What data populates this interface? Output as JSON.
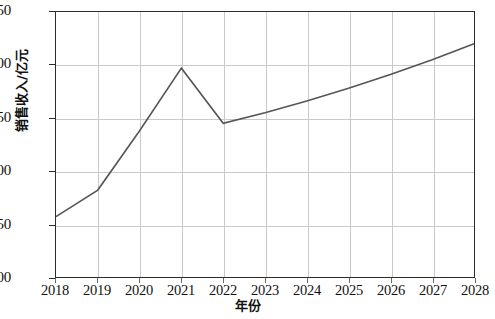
{
  "chart_data": {
    "type": "line",
    "title": "",
    "subtitle": "",
    "xlabel": "年份",
    "ylabel": "销售收入/亿元",
    "x": [
      2018,
      2019,
      2020,
      2021,
      2022,
      2023,
      2024,
      2025,
      2026,
      2027,
      2028
    ],
    "categories": [
      "2018",
      "2019",
      "2020",
      "2021",
      "2022",
      "2023",
      "2024",
      "2025",
      "2026",
      "2027",
      "2028"
    ],
    "values": [
      257,
      282,
      338,
      397,
      345,
      355,
      366,
      378,
      391,
      405,
      420
    ],
    "series": [
      {
        "name": "销售收入",
        "values": [
          257,
          282,
          338,
          397,
          345,
          355,
          366,
          378,
          391,
          405,
          420
        ]
      }
    ],
    "xlim": [
      2018,
      2028
    ],
    "ylim": [
      200,
      450
    ],
    "yticks": [
      200,
      250,
      300,
      350,
      400,
      450
    ],
    "ytick_labels": [
      "200",
      "250",
      "300",
      "350",
      "400",
      "450"
    ],
    "xticks": [
      2018,
      2019,
      2020,
      2021,
      2022,
      2023,
      2024,
      2025,
      2026,
      2027,
      2028
    ],
    "xtick_labels": [
      "2018",
      "2019",
      "2020",
      "2021",
      "2022",
      "2023",
      "2024",
      "2025",
      "2026",
      "2027",
      "2028"
    ],
    "grid": true,
    "grid_color": "#c9c9c9",
    "legend": false,
    "legend_position": "none",
    "line_color": "#555555",
    "line_width": 1.6,
    "markers": false,
    "frame_color": "#2b2b2b",
    "background": "#ffffff",
    "annotations": []
  }
}
